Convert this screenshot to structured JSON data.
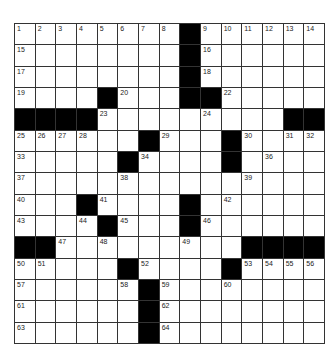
{
  "puzzle": {
    "rows": 15,
    "cols": 15,
    "colors": {
      "block": "#000000",
      "cell": "#ffffff",
      "line": "#333333"
    },
    "layout": [
      "........#......",
      "........#......",
      "........#......",
      "....#...##.....",
      "####.........##",
      "......#...#....",
      ".....#....#....",
      "...............",
      "...#....#......",
      "....#...#......",
      "##.........####",
      ".....#....#....",
      "......#........",
      "......#........",
      "......#........"
    ],
    "numbers": [
      {
        "r": 0,
        "c": 0,
        "n": "1"
      },
      {
        "r": 0,
        "c": 1,
        "n": "2"
      },
      {
        "r": 0,
        "c": 2,
        "n": "3"
      },
      {
        "r": 0,
        "c": 3,
        "n": "4"
      },
      {
        "r": 0,
        "c": 4,
        "n": "5"
      },
      {
        "r": 0,
        "c": 5,
        "n": "6"
      },
      {
        "r": 0,
        "c": 6,
        "n": "7"
      },
      {
        "r": 0,
        "c": 7,
        "n": "8"
      },
      {
        "r": 0,
        "c": 9,
        "n": "9"
      },
      {
        "r": 0,
        "c": 10,
        "n": "10"
      },
      {
        "r": 0,
        "c": 11,
        "n": "11"
      },
      {
        "r": 0,
        "c": 12,
        "n": "12"
      },
      {
        "r": 0,
        "c": 13,
        "n": "13"
      },
      {
        "r": 0,
        "c": 14,
        "n": "14"
      },
      {
        "r": 1,
        "c": 0,
        "n": "15"
      },
      {
        "r": 1,
        "c": 9,
        "n": "16"
      },
      {
        "r": 2,
        "c": 0,
        "n": "17"
      },
      {
        "r": 2,
        "c": 9,
        "n": "18"
      },
      {
        "r": 3,
        "c": 0,
        "n": "19"
      },
      {
        "r": 3,
        "c": 5,
        "n": "20"
      },
      {
        "r": 3,
        "c": 8,
        "n": "21"
      },
      {
        "r": 3,
        "c": 10,
        "n": "22"
      },
      {
        "r": 4,
        "c": 4,
        "n": "23"
      },
      {
        "r": 4,
        "c": 9,
        "n": "24"
      },
      {
        "r": 5,
        "c": 0,
        "n": "25"
      },
      {
        "r": 5,
        "c": 1,
        "n": "26"
      },
      {
        "r": 5,
        "c": 2,
        "n": "27"
      },
      {
        "r": 5,
        "c": 3,
        "n": "28"
      },
      {
        "r": 5,
        "c": 7,
        "n": "29"
      },
      {
        "r": 5,
        "c": 11,
        "n": "30"
      },
      {
        "r": 5,
        "c": 13,
        "n": "31"
      },
      {
        "r": 5,
        "c": 14,
        "n": "32"
      },
      {
        "r": 6,
        "c": 0,
        "n": "33"
      },
      {
        "r": 6,
        "c": 6,
        "n": "34"
      },
      {
        "r": 6,
        "c": 10,
        "n": "35"
      },
      {
        "r": 6,
        "c": 12,
        "n": "36"
      },
      {
        "r": 7,
        "c": 0,
        "n": "37"
      },
      {
        "r": 7,
        "c": 5,
        "n": "38"
      },
      {
        "r": 7,
        "c": 11,
        "n": "39"
      },
      {
        "r": 8,
        "c": 0,
        "n": "40"
      },
      {
        "r": 8,
        "c": 4,
        "n": "41"
      },
      {
        "r": 8,
        "c": 10,
        "n": "42"
      },
      {
        "r": 9,
        "c": 0,
        "n": "43"
      },
      {
        "r": 9,
        "c": 3,
        "n": "44"
      },
      {
        "r": 9,
        "c": 5,
        "n": "45"
      },
      {
        "r": 9,
        "c": 9,
        "n": "46"
      },
      {
        "r": 10,
        "c": 2,
        "n": "47"
      },
      {
        "r": 10,
        "c": 4,
        "n": "48"
      },
      {
        "r": 10,
        "c": 8,
        "n": "49"
      },
      {
        "r": 11,
        "c": 0,
        "n": "50"
      },
      {
        "r": 11,
        "c": 1,
        "n": "51"
      },
      {
        "r": 11,
        "c": 6,
        "n": "52"
      },
      {
        "r": 11,
        "c": 11,
        "n": "53"
      },
      {
        "r": 11,
        "c": 12,
        "n": "54"
      },
      {
        "r": 11,
        "c": 13,
        "n": "55"
      },
      {
        "r": 11,
        "c": 14,
        "n": "56"
      },
      {
        "r": 12,
        "c": 0,
        "n": "57"
      },
      {
        "r": 12,
        "c": 5,
        "n": "58"
      },
      {
        "r": 12,
        "c": 7,
        "n": "59"
      },
      {
        "r": 12,
        "c": 10,
        "n": "60"
      },
      {
        "r": 13,
        "c": 0,
        "n": "61"
      },
      {
        "r": 13,
        "c": 7,
        "n": "62"
      },
      {
        "r": 14,
        "c": 0,
        "n": "63"
      },
      {
        "r": 14,
        "c": 7,
        "n": "64"
      }
    ]
  }
}
